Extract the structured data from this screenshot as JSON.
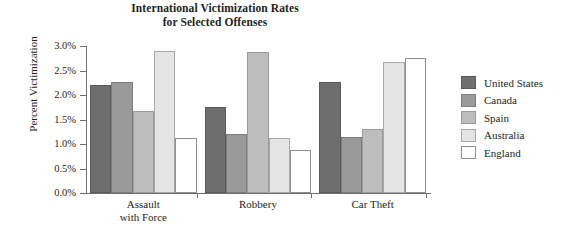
{
  "chart_data": {
    "type": "bar",
    "title": "International Victimization Rates for Selected Offenses",
    "title_lines": [
      "International Victimization Rates",
      "for Selected Offenses"
    ],
    "xlabel": "",
    "ylabel": "Percent Victimization",
    "ylim": [
      0.0,
      3.0
    ],
    "ytick_labels": [
      "0.0%",
      "0.5%",
      "1.0%",
      "1.5%",
      "2.0%",
      "2.5%",
      "3.0%"
    ],
    "ytick_values": [
      0.0,
      0.5,
      1.0,
      1.5,
      2.0,
      2.5,
      3.0
    ],
    "grid": false,
    "legend_position": "right",
    "categories": [
      "Assault with Force",
      "Robbery",
      "Car Theft"
    ],
    "category_label_lines": [
      [
        "Assault",
        "with Force"
      ],
      [
        "Robbery"
      ],
      [
        "Car Theft"
      ]
    ],
    "series": [
      {
        "name": "United States",
        "color": "#6e6e6e",
        "values": [
          2.2,
          1.75,
          2.27
        ]
      },
      {
        "name": "Canada",
        "color": "#9a9a9a",
        "values": [
          2.27,
          1.2,
          1.15
        ]
      },
      {
        "name": "Spain",
        "color": "#bdbdbd",
        "values": [
          1.67,
          2.87,
          1.3
        ]
      },
      {
        "name": "Australia",
        "color": "#e4e4e4",
        "values": [
          2.9,
          1.12,
          2.67
        ]
      },
      {
        "name": "England",
        "color": "#ffffff",
        "values": [
          1.13,
          0.88,
          2.75
        ]
      }
    ]
  },
  "legend": {
    "items": [
      {
        "label": "United States"
      },
      {
        "label": "Canada"
      },
      {
        "label": "Spain"
      },
      {
        "label": "Australia"
      },
      {
        "label": "England"
      }
    ]
  }
}
